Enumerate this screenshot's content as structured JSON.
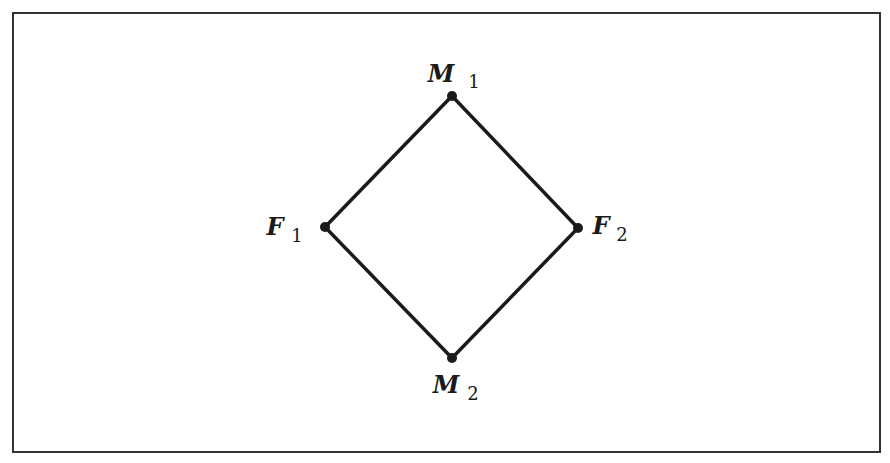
{
  "diagram": {
    "type": "lattice",
    "frame": {
      "x": 13,
      "y": 13,
      "width": 867,
      "height": 439,
      "stroke": "#333333"
    },
    "edge_color": "#1a1a1a",
    "nodes": [
      {
        "id": "M1",
        "letter": "M",
        "subscript": "1",
        "x": 452,
        "y": 96
      },
      {
        "id": "F1",
        "letter": "F",
        "subscript": "1",
        "x": 325,
        "y": 227
      },
      {
        "id": "F2",
        "letter": "F",
        "subscript": "2",
        "x": 578,
        "y": 228
      },
      {
        "id": "M2",
        "letter": "M",
        "subscript": "2",
        "x": 452,
        "y": 358
      }
    ],
    "edges": [
      {
        "from": "M1",
        "to": "F1"
      },
      {
        "from": "M1",
        "to": "F2"
      },
      {
        "from": "F1",
        "to": "M2"
      },
      {
        "from": "F2",
        "to": "M2"
      }
    ],
    "labels": {
      "M1": {
        "letter": "M",
        "subscript": "1"
      },
      "F1": {
        "letter": "F",
        "subscript": "1"
      },
      "F2": {
        "letter": "F",
        "subscript": "2"
      },
      "M2": {
        "letter": "M",
        "subscript": "2"
      }
    }
  }
}
